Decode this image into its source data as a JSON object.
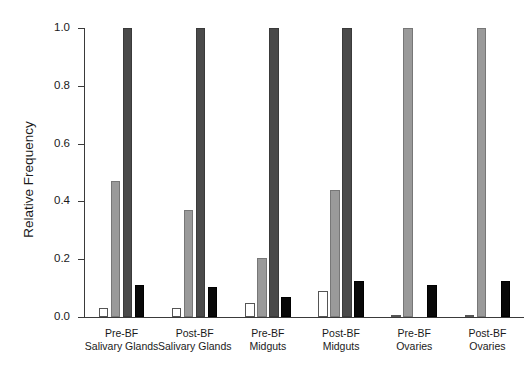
{
  "chart_data": {
    "type": "bar",
    "title": "",
    "xlabel": "",
    "ylabel": "Relative Frequency",
    "ylim": [
      0.0,
      1.0
    ],
    "ytick_labels": [
      "1.0",
      "0.8",
      "0.6",
      "0.4",
      "0.2",
      "0.0"
    ],
    "ytick_values": [
      1.0,
      0.8,
      0.6,
      0.4,
      0.2,
      0.0
    ],
    "grid": false,
    "legend": "none",
    "categories": [
      "Pre-BF Salivary Glands",
      "Post-BF Salivary Glands",
      "Pre-BF Midguts",
      "Post-BF Midguts",
      "Pre-BF Ovaries",
      "Post-BF Ovaries"
    ],
    "category_lines": [
      {
        "line1": "Pre-BF",
        "line2": "Salivary Glands"
      },
      {
        "line1": "Post-BF",
        "line2": "Salivary Glands"
      },
      {
        "line1": "Pre-BF",
        "line2": "Midguts"
      },
      {
        "line1": "Post-BF",
        "line2": "Midguts"
      },
      {
        "line1": "Pre-BF",
        "line2": "Ovaries"
      },
      {
        "line1": "Post-BF",
        "line2": "Ovaries"
      }
    ],
    "series": [
      {
        "name": "series-1",
        "style": "white",
        "color": "#ffffff",
        "values": [
          0.03,
          0.03,
          0.05,
          0.09,
          0.005,
          0.005
        ]
      },
      {
        "name": "series-2",
        "style": "lightgray",
        "color": "#9a9a9a",
        "values": [
          0.47,
          0.37,
          0.205,
          0.44,
          1.0,
          1.0
        ]
      },
      {
        "name": "series-3",
        "style": "darkgray",
        "color": "#4a4a4a",
        "values": [
          1.0,
          1.0,
          1.0,
          1.0,
          0.0,
          0.0
        ]
      },
      {
        "name": "series-4",
        "style": "black",
        "color": "#080808",
        "values": [
          0.11,
          0.105,
          0.07,
          0.125,
          0.11,
          0.125
        ]
      }
    ]
  }
}
